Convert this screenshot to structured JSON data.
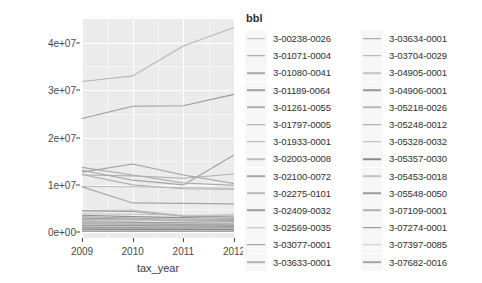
{
  "chart_data": {
    "type": "line",
    "title": "",
    "xlabel": "tax_year",
    "ylabel": "full_market_value",
    "x": [
      2009,
      2010,
      2011,
      2012
    ],
    "xticklabels": [
      "2009",
      "2010",
      "2011",
      "2012"
    ],
    "xlim": [
      2009,
      2012
    ],
    "yticks": [
      0,
      10000000,
      20000000,
      30000000,
      40000000
    ],
    "yticklabels": [
      "0e+00",
      "1e+07",
      "2e+07",
      "3e+07",
      "4e+07"
    ],
    "ylim": [
      -1200000,
      45000000
    ],
    "grid": true,
    "legend_position": "right",
    "legend_title": "bbl",
    "series": [
      {
        "name": "3-00238-0026",
        "color": "#b6b6b6",
        "values": [
          31800000,
          33000000,
          39300000,
          43200000
        ]
      },
      {
        "name": "3-01071-0004",
        "color": "#9a9a9a",
        "values": [
          24000000,
          26600000,
          26700000,
          29100000
        ]
      },
      {
        "name": "3-01080-0041",
        "color": "#a8a8a8",
        "values": [
          13700000,
          12100000,
          10400000,
          9900000
        ]
      },
      {
        "name": "3-01189-0064",
        "color": "#9f9f9f",
        "values": [
          12700000,
          14400000,
          12100000,
          10300000
        ]
      },
      {
        "name": "3-01261-0055",
        "color": "#b0b0b0",
        "values": [
          12100000,
          11900000,
          11400000,
          12300000
        ]
      },
      {
        "name": "3-01797-0005",
        "color": "#a3a3a3",
        "values": [
          13100000,
          11000000,
          10000000,
          16300000
        ]
      },
      {
        "name": "3-01933-0001",
        "color": "#adadad",
        "values": [
          12200000,
          10000000,
          9200000,
          9100000
        ]
      },
      {
        "name": "3-02003-0008",
        "color": "#bdbdbd",
        "values": [
          9700000,
          9600000,
          9400000,
          9300000
        ]
      },
      {
        "name": "3-02100-0072",
        "color": "#a6a6a6",
        "values": [
          9600000,
          6200000,
          6100000,
          6000000
        ]
      },
      {
        "name": "3-02275-0101",
        "color": "#b9b9b9",
        "values": [
          4600000,
          4700000,
          3500000,
          3700000
        ]
      },
      {
        "name": "3-02409-0032",
        "color": "#9c9c9c",
        "values": [
          4500000,
          4400000,
          3400000,
          3300000
        ]
      },
      {
        "name": "3-02569-0035",
        "color": "#c2c2c2",
        "values": [
          3900000,
          3800000,
          3600000,
          3500000
        ]
      },
      {
        "name": "3-03077-0001",
        "color": "#8f8f8f",
        "values": [
          3600000,
          3300000,
          3100000,
          3000000
        ]
      },
      {
        "name": "3-03633-0001",
        "color": "#b3b3b3",
        "values": [
          3300000,
          3000000,
          2800000,
          2700000
        ]
      },
      {
        "name": "3-03634-0001",
        "color": "#9e9e9e",
        "values": [
          3000000,
          2800000,
          2600000,
          2500000
        ]
      },
      {
        "name": "3-03704-0029",
        "color": "#ababab",
        "values": [
          2700000,
          2600000,
          2400000,
          2300000
        ]
      },
      {
        "name": "3-04905-0001",
        "color": "#c5c5c5",
        "values": [
          2500000,
          2400000,
          2900000,
          3200000
        ]
      },
      {
        "name": "3-04906-0001",
        "color": "#969696",
        "values": [
          2200000,
          2100000,
          2000000,
          1900000
        ]
      },
      {
        "name": "3-05218-0026",
        "color": "#bababa",
        "values": [
          2000000,
          1900000,
          1800000,
          1750000
        ]
      },
      {
        "name": "3-05248-0012",
        "color": "#a1a1a1",
        "values": [
          1800000,
          1700000,
          1650000,
          1600000
        ]
      },
      {
        "name": "3-05328-0032",
        "color": "#b5b5b5",
        "values": [
          1600000,
          1550000,
          1500000,
          1450000
        ]
      },
      {
        "name": "3-05357-0030",
        "color": "#8b8b8b",
        "values": [
          1400000,
          1350000,
          1300000,
          1250000
        ]
      },
      {
        "name": "3-05453-0018",
        "color": "#c0c0c0",
        "values": [
          1200000,
          1150000,
          1100000,
          1080000
        ]
      },
      {
        "name": "3-05548-0050",
        "color": "#9d9d9d",
        "values": [
          1000000,
          980000,
          950000,
          930000
        ]
      },
      {
        "name": "3-07109-0001",
        "color": "#afafaf",
        "values": [
          800000,
          790000,
          770000,
          760000
        ]
      },
      {
        "name": "3-07274-0001",
        "color": "#848484",
        "values": [
          600000,
          590000,
          580000,
          570000
        ]
      },
      {
        "name": "3-07397-0085",
        "color": "#c8c8c8",
        "values": [
          400000,
          395000,
          390000,
          385000
        ]
      },
      {
        "name": "3-07682-0016",
        "color": "#a4a4a4",
        "values": [
          200000,
          198000,
          195000,
          192000
        ]
      }
    ]
  },
  "axes": {
    "x_title": "tax_year",
    "y_title": "full_market_value"
  },
  "legend": {
    "title": "bbl",
    "columns": [
      [
        "3-00238-0026",
        "3-01071-0004",
        "3-01080-0041",
        "3-01189-0064",
        "3-01261-0055",
        "3-01797-0005",
        "3-01933-0001",
        "3-02003-0008",
        "3-02100-0072",
        "3-02275-0101",
        "3-02409-0032",
        "3-02569-0035",
        "3-03077-0001",
        "3-03633-0001"
      ],
      [
        "3-03634-0001",
        "3-03704-0029",
        "3-04905-0001",
        "3-04906-0001",
        "3-05218-0026",
        "3-05248-0012",
        "3-05328-0032",
        "3-05357-0030",
        "3-05453-0018",
        "3-05548-0050",
        "3-07109-0001",
        "3-07274-0001",
        "3-07397-0085",
        "3-07682-0016"
      ]
    ]
  },
  "colors": {
    "panel_background": "#ebebeb",
    "gridline": "#ffffff",
    "text": "#4a4a4a",
    "page_background": "#ffffff"
  }
}
